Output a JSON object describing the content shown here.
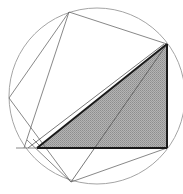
{
  "diagram": {
    "width": 183,
    "height": 194,
    "colors": {
      "background": "#ffffff",
      "circle": "#9a9a9a",
      "thin_line": "#6a6a6a",
      "thick_line": "#1a1a1a",
      "shade": "#a8a8a8"
    },
    "circle": {
      "cx": 97,
      "cy": 96,
      "r": 88
    },
    "points": {
      "A": [
        37,
        148
      ],
      "B": [
        167,
        148
      ],
      "C": [
        167,
        44
      ],
      "T": [
        69,
        12
      ],
      "L": [
        9,
        98
      ],
      "D": [
        71,
        182
      ],
      "H": [
        16,
        148
      ]
    }
  }
}
